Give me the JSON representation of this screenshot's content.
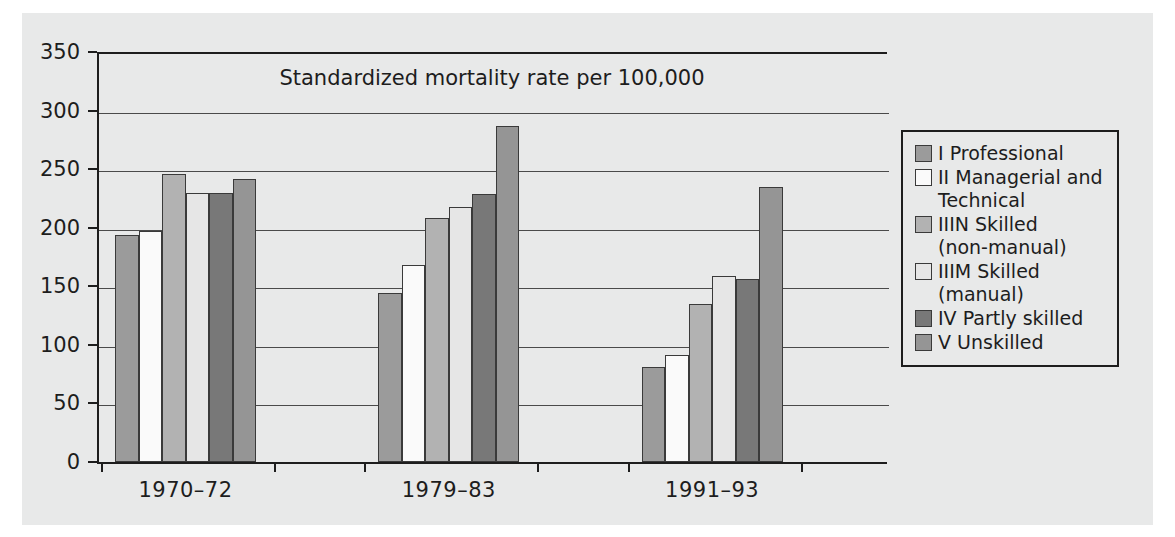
{
  "chart_data": {
    "type": "bar",
    "title": "Standardized mortality rate per 100,000",
    "xlabel": "",
    "ylabel": "",
    "ylim": [
      0,
      350
    ],
    "yticks": [
      0,
      50,
      100,
      150,
      200,
      250,
      300,
      350
    ],
    "ytick_labels": [
      "0",
      "50",
      "100",
      "150",
      "200",
      "250",
      "300",
      "350"
    ],
    "grid": true,
    "legend_position": "right",
    "categories": [
      "1970–72",
      "1979–83",
      "1991–93"
    ],
    "series": [
      {
        "name": "I Professional",
        "color": "#9b9b9b",
        "values": [
          194,
          144,
          81
        ]
      },
      {
        "name": "II Managerial and\nTechnical",
        "color": "#fafafa",
        "values": [
          197,
          168,
          91
        ]
      },
      {
        "name": "IIIN Skilled\n(non-manual)",
        "color": "#b2b2b2",
        "values": [
          246,
          208,
          135
        ]
      },
      {
        "name": "IIIM Skilled\n(manual)",
        "color": "#e6e6e6",
        "values": [
          230,
          218,
          159
        ]
      },
      {
        "name": "IV Partly skilled",
        "color": "#787878",
        "values": [
          230,
          229,
          156
        ]
      },
      {
        "name": "V Unskilled",
        "color": "#959595",
        "values": [
          242,
          287,
          235
        ]
      }
    ]
  },
  "legend": {
    "items": [
      {
        "label": "I Professional",
        "color": "#9b9b9b"
      },
      {
        "label": "II Managerial and\nTechnical",
        "color": "#fafafa"
      },
      {
        "label": "IIIN Skilled\n(non-manual)",
        "color": "#b2b2b2"
      },
      {
        "label": "IIIM Skilled\n(manual)",
        "color": "#e6e6e6"
      },
      {
        "label": "IV Partly skilled",
        "color": "#787878"
      },
      {
        "label": "V Unskilled",
        "color": "#959595"
      }
    ]
  }
}
